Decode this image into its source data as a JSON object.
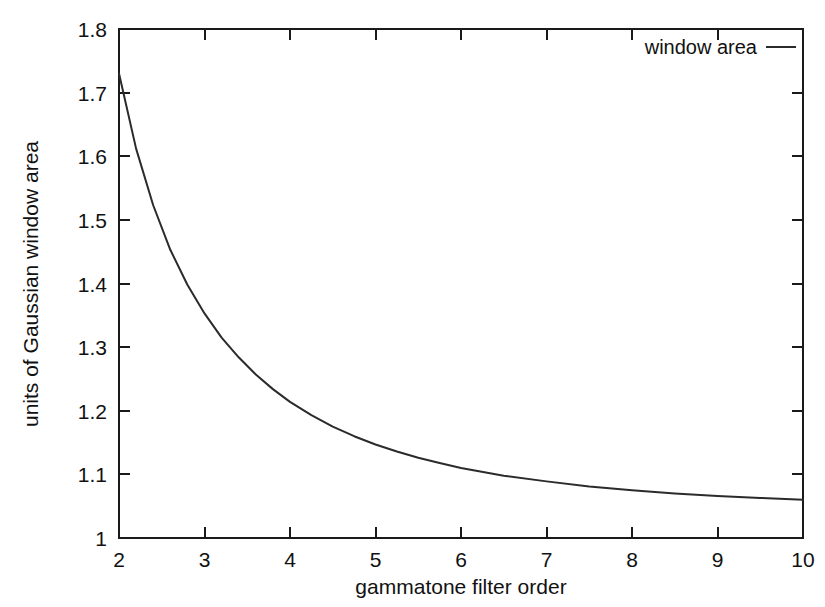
{
  "chart_data": {
    "type": "line",
    "title": "",
    "xlabel": "gammatone filter order",
    "ylabel": "units of Gaussian window area",
    "xlim": [
      2,
      10
    ],
    "ylim": [
      1,
      1.8
    ],
    "xticks": [
      "2",
      "3",
      "4",
      "5",
      "6",
      "7",
      "8",
      "9",
      "10"
    ],
    "yticks": [
      "1",
      "1.1",
      "1.2",
      "1.3",
      "1.4",
      "1.5",
      "1.6",
      "1.7",
      "1.8"
    ],
    "grid": false,
    "legend_position": "top-right",
    "series": [
      {
        "name": "window area",
        "color": "#2b2b2b",
        "x": [
          2,
          2.2,
          2.4,
          2.6,
          2.8,
          3,
          3.2,
          3.4,
          3.6,
          3.8,
          4,
          4.25,
          4.5,
          4.75,
          5,
          5.25,
          5.5,
          5.75,
          6,
          6.5,
          7,
          7.5,
          8,
          8.5,
          9,
          9.5,
          10
        ],
        "values": [
          1.73,
          1.612,
          1.523,
          1.453,
          1.398,
          1.353,
          1.315,
          1.284,
          1.257,
          1.234,
          1.214,
          1.193,
          1.175,
          1.16,
          1.147,
          1.136,
          1.126,
          1.118,
          1.11,
          1.098,
          1.089,
          1.081,
          1.075,
          1.07,
          1.066,
          1.063,
          1.06
        ]
      }
    ],
    "legend_entries": [
      {
        "label": "window area",
        "color": "#2b2b2b"
      }
    ]
  },
  "axis": {
    "x_label": "gammatone filter order",
    "y_label": "units of Gaussian window area",
    "x_tick_labels": [
      "2",
      "3",
      "4",
      "5",
      "6",
      "7",
      "8",
      "9",
      "10"
    ],
    "y_tick_labels": [
      "1.8",
      "1.7",
      "1.6",
      "1.5",
      "1.4",
      "1.3",
      "1.2",
      "1.1",
      "1"
    ]
  },
  "legend": {
    "entry_label": "window area"
  },
  "colors": {
    "background": "#ffffff",
    "axis": "#1a1a1a",
    "curve": "#2b2b2b",
    "text": "#111111"
  }
}
